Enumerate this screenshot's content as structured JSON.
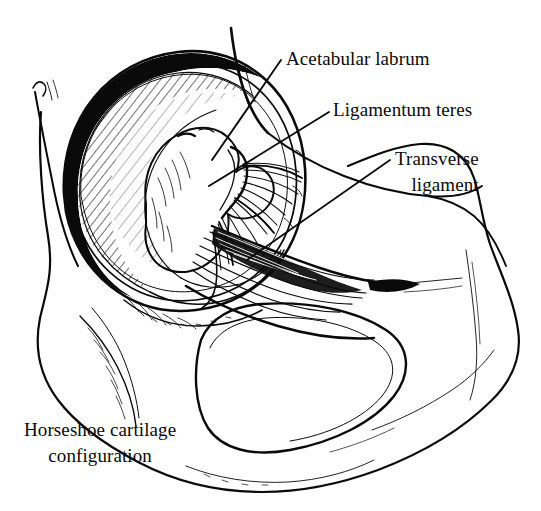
{
  "figure": {
    "background_color": "#ffffff",
    "ink_color": "#0a0a0a",
    "width": 541,
    "height": 511,
    "style": "black-and-white pen-and-ink line drawing"
  },
  "labels": {
    "acetabular_labrum": "Acetabular labrum",
    "ligamentum_teres": "Ligamentum teres",
    "transverse_ligament_line1": "Transverse",
    "transverse_ligament_line2": "ligament",
    "horseshoe_line1": "Horseshoe cartilage",
    "horseshoe_line2": "configuration"
  },
  "structures": [
    {
      "name": "acetabular-labrum",
      "label": "Acetabular labrum",
      "has_leader_line": true
    },
    {
      "name": "ligamentum-teres",
      "label": "Ligamentum teres",
      "has_leader_line": true
    },
    {
      "name": "transverse-ligament",
      "label": "Transverse ligament",
      "has_leader_line": true
    },
    {
      "name": "horseshoe-cartilage",
      "label": "Horseshoe cartilage configuration",
      "has_leader_line": false
    },
    {
      "name": "acetabular-fossa",
      "label": "",
      "has_leader_line": false
    },
    {
      "name": "obturator-foramen",
      "label": "",
      "has_leader_line": false
    },
    {
      "name": "innominate-bone",
      "label": "",
      "has_leader_line": false
    }
  ]
}
